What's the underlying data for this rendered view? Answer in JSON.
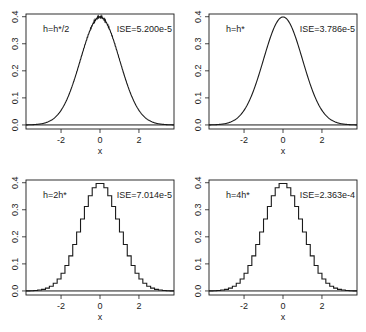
{
  "figure": {
    "layout": "2x2 grid",
    "ink_color": "#1a1a1a",
    "background": "#ffffff"
  },
  "chart_data": [
    {
      "type": "line",
      "panel": "top-left",
      "label_left": "h=h*/2",
      "label_right": "ISE=5.200e-5",
      "xlabel": "x",
      "ylabel": "",
      "xlim": [
        -3.8,
        3.8
      ],
      "ylim": [
        -0.015,
        0.41
      ],
      "xticks": [
        -2,
        0,
        2
      ],
      "xtick_labels": [
        "-2",
        "0",
        "2"
      ],
      "yticks": [
        0.0,
        0.1,
        0.2,
        0.3,
        0.4
      ],
      "ytick_labels": [
        "0.0",
        "0.1",
        "0.2",
        "0.3",
        "0.4"
      ],
      "curve": "normal density estimate (slightly noisy)",
      "bin_width": 0.05,
      "peak": 0.4,
      "ise": 5.2e-05,
      "baseline_y": 0.0
    },
    {
      "type": "line",
      "panel": "top-right",
      "label_left": "h=h*",
      "label_right": "ISE=3.786e-5",
      "xlabel": "x",
      "ylabel": "",
      "xlim": [
        -3.8,
        3.8
      ],
      "ylim": [
        -0.015,
        0.41
      ],
      "xticks": [
        -2,
        0,
        2
      ],
      "xtick_labels": [
        "-2",
        "0",
        "2"
      ],
      "yticks": [
        0.0,
        0.1,
        0.2,
        0.3,
        0.4
      ],
      "ytick_labels": [
        "0.0",
        "0.1",
        "0.2",
        "0.3",
        "0.4"
      ],
      "curve": "normal density estimate (fine steps)",
      "bin_width": 0.1,
      "peak": 0.4,
      "ise": 3.786e-05,
      "baseline_y": 0.0
    },
    {
      "type": "line",
      "panel": "bottom-left",
      "label_left": "h=2h*",
      "label_right": "ISE=7.014e-5",
      "xlabel": "x",
      "ylabel": "",
      "xlim": [
        -3.8,
        3.8
      ],
      "ylim": [
        -0.015,
        0.41
      ],
      "xticks": [
        -2,
        0,
        2
      ],
      "xtick_labels": [
        "-2",
        "0",
        "2"
      ],
      "yticks": [
        0.0,
        0.1,
        0.2,
        0.3,
        0.4
      ],
      "ytick_labels": [
        "0.0",
        "0.1",
        "0.2",
        "0.3",
        "0.4"
      ],
      "curve": "normal density histogram (small steps)",
      "bin_width": 0.2,
      "peak": 0.4,
      "ise": 7.014e-05,
      "baseline_y": 0.0
    },
    {
      "type": "line",
      "panel": "bottom-right",
      "label_left": "h=4h*",
      "label_right": "ISE=2.363e-4",
      "xlabel": "x",
      "ylabel": "",
      "xlim": [
        -3.8,
        3.8
      ],
      "ylim": [
        -0.015,
        0.41
      ],
      "xticks": [
        -2,
        0,
        2
      ],
      "xtick_labels": [
        "-2",
        "0",
        "2"
      ],
      "yticks": [
        0.0,
        0.1,
        0.2,
        0.3,
        0.4
      ],
      "ytick_labels": [
        "0.0",
        "0.1",
        "0.2",
        "0.3",
        "0.4"
      ],
      "curve": "normal density histogram (visible stair steps)",
      "bin_width": 0.2,
      "step_style": "staircase",
      "peak": 0.4,
      "ise": 0.0002363,
      "baseline_y": 0.0
    }
  ]
}
